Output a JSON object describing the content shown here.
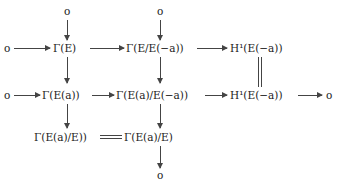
{
  "diagram": {
    "type": "commutative-diagram",
    "nodes": {
      "top_zero_1": "o",
      "top_zero_2": "o",
      "r1_zero": "o",
      "r1_gamma_E": "Γ(E)",
      "r1_gamma_quot": "Γ(E/E(−a))",
      "r1_H1": "H¹(E(−a))",
      "r2_zero_left": "o",
      "r2_gamma_Ea": "Γ(E(a))",
      "r2_gamma_quot": "Γ(E(a)/E(−a))",
      "r2_H1": "H¹(E(−a))",
      "r2_zero_right": "o",
      "r3_gamma_left": "Γ(E(a)/E))",
      "r3_gamma_right": "Γ(E(a)/E)",
      "bottom_zero": "o"
    },
    "edges": [
      {
        "from": "top_zero_1",
        "to": "r1_gamma_E",
        "style": "arrow"
      },
      {
        "from": "top_zero_2",
        "to": "r1_gamma_quot",
        "style": "arrow"
      },
      {
        "from": "r1_zero",
        "to": "r1_gamma_E",
        "style": "arrow"
      },
      {
        "from": "r1_gamma_E",
        "to": "r1_gamma_quot",
        "style": "arrow"
      },
      {
        "from": "r1_gamma_quot",
        "to": "r1_H1",
        "style": "arrow"
      },
      {
        "from": "r1_gamma_E",
        "to": "r2_gamma_Ea",
        "style": "arrow"
      },
      {
        "from": "r1_gamma_quot",
        "to": "r2_gamma_quot",
        "style": "arrow"
      },
      {
        "from": "r1_H1",
        "to": "r2_H1",
        "style": "equals"
      },
      {
        "from": "r2_zero_left",
        "to": "r2_gamma_Ea",
        "style": "arrow"
      },
      {
        "from": "r2_gamma_Ea",
        "to": "r2_gamma_quot",
        "style": "arrow"
      },
      {
        "from": "r2_gamma_quot",
        "to": "r2_H1",
        "style": "arrow"
      },
      {
        "from": "r2_H1",
        "to": "r2_zero_right",
        "style": "arrow"
      },
      {
        "from": "r2_gamma_Ea",
        "to": "r3_gamma_left",
        "style": "arrow"
      },
      {
        "from": "r2_gamma_quot",
        "to": "r3_gamma_right",
        "style": "arrow"
      },
      {
        "from": "r3_gamma_left",
        "to": "r3_gamma_right",
        "style": "equals"
      },
      {
        "from": "r3_gamma_right",
        "to": "bottom_zero",
        "style": "arrow"
      }
    ]
  }
}
